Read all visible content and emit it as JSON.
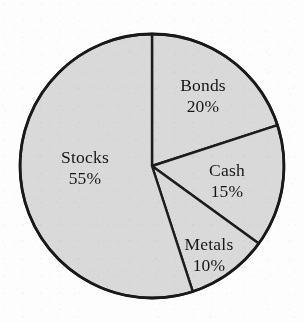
{
  "figure": {
    "kind": "pie-chart",
    "background_color": "#fdfdfd",
    "slice_fill_color": "#d9d9d9",
    "outline_color": "#191919",
    "label_color": "#171717"
  },
  "chart_data": {
    "type": "pie",
    "title": "",
    "subtitle": "",
    "xlabel": "",
    "ylabel": "",
    "legend_position": "none",
    "grid": false,
    "labels_inside_slices": true,
    "start_angle_deg": 0,
    "direction": "clockwise",
    "categories": [
      "Bonds",
      "Cash",
      "Metals",
      "Stocks"
    ],
    "values": [
      20,
      15,
      10,
      55
    ],
    "value_unit": "%",
    "slices": [
      {
        "name": "Bonds",
        "value": 20,
        "label": "Bonds",
        "percent_label": "20%",
        "start_deg": 0,
        "end_deg": 72,
        "fill": "#d9d9d9",
        "label_x": 203,
        "label_y": 91
      },
      {
        "name": "Cash",
        "value": 15,
        "label": "Cash",
        "percent_label": "15%",
        "start_deg": 72,
        "end_deg": 126,
        "fill": "#d9d9d9",
        "label_x": 227,
        "label_y": 176
      },
      {
        "name": "Metals",
        "value": 10,
        "label": "Metals",
        "percent_label": "10%",
        "start_deg": 126,
        "end_deg": 162,
        "fill": "#d9d9d9",
        "label_x": 209,
        "label_y": 250
      },
      {
        "name": "Stocks",
        "value": 55,
        "label": "Stocks",
        "percent_label": "55%",
        "start_deg": 162,
        "end_deg": 360,
        "fill": "#d9d9d9",
        "label_x": 85,
        "label_y": 163
      }
    ],
    "geometry": {
      "center_x": 152,
      "center_y": 166,
      "radius": 132
    }
  }
}
